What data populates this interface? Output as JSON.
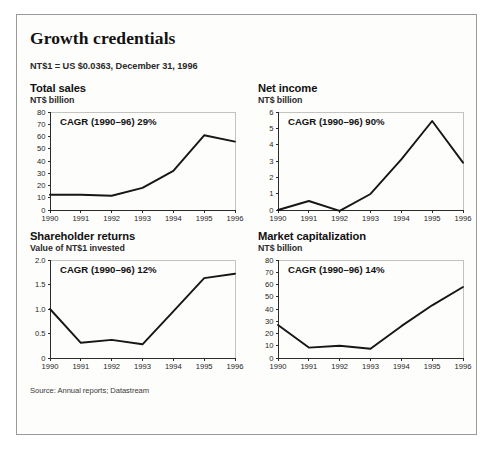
{
  "exhibit": {
    "title": "Growth credentials",
    "note": "NT$1 = US $0.0363, December 31, 1996",
    "source": "Source: Annual reports; Datastream"
  },
  "chart_data": [
    {
      "id": "total-sales",
      "type": "line",
      "title": "Total sales",
      "subtitle": "NT$ billion",
      "annotation": "CAGR (1990–96) 29%",
      "xlabel": "",
      "ylabel": "NT$ billion",
      "categories": [
        "1990",
        "1991",
        "1992",
        "1993",
        "1994",
        "1995",
        "1996"
      ],
      "values": [
        12.5,
        12.4,
        11.6,
        18.0,
        32.0,
        61.0,
        55.8
      ],
      "ylim": [
        0,
        80
      ],
      "yticks": [
        0,
        10,
        20,
        30,
        40,
        50,
        60,
        70,
        80
      ],
      "yticklabels": [
        "0",
        "10",
        "20",
        "30",
        "40",
        "50",
        "60",
        "70",
        "80"
      ],
      "grid": false,
      "legend": "none"
    },
    {
      "id": "net-income",
      "type": "line",
      "title": "Net income",
      "subtitle": "NT$ billion",
      "annotation": "CAGR (1990–96) 90%",
      "xlabel": "",
      "ylabel": "NT$ billion",
      "categories": [
        "1990",
        "1991",
        "1992",
        "1993",
        "1994",
        "1995",
        "1996"
      ],
      "values": [
        0.0,
        0.55,
        -0.05,
        0.98,
        3.1,
        5.45,
        2.9
      ],
      "ylim": [
        0,
        6
      ],
      "yticks": [
        0,
        1,
        2,
        3,
        4,
        5,
        6
      ],
      "yticklabels": [
        "0",
        "1",
        "2",
        "3",
        "4",
        "5",
        "6"
      ],
      "grid": false,
      "legend": "none"
    },
    {
      "id": "shareholder-returns",
      "type": "line",
      "title": "Shareholder returns",
      "subtitle": "Value of NT$1 invested",
      "annotation": "CAGR (1990–96) 12%",
      "xlabel": "",
      "ylabel": "Value of NT$1 invested",
      "categories": [
        "1990",
        "1991",
        "1992",
        "1993",
        "1994",
        "1995",
        "1996"
      ],
      "values": [
        1.0,
        0.31,
        0.37,
        0.28,
        0.95,
        1.63,
        1.72
      ],
      "ylim": [
        0,
        2.0
      ],
      "yticks": [
        0,
        0.5,
        1.0,
        1.5,
        2.0
      ],
      "yticklabels": [
        "0",
        "0.5",
        "1.0",
        "1.5",
        "2.0"
      ],
      "grid": false,
      "legend": "none"
    },
    {
      "id": "market-capitalization",
      "type": "line",
      "title": "Market capitalization",
      "subtitle": "NT$ billion",
      "annotation": "CAGR (1990–96) 14%",
      "xlabel": "",
      "ylabel": "NT$ billion",
      "categories": [
        "1990",
        "1991",
        "1992",
        "1993",
        "1994",
        "1995",
        "1996"
      ],
      "values": [
        27.0,
        8.5,
        10.0,
        7.5,
        26.0,
        43.0,
        58.0
      ],
      "ylim": [
        0,
        80
      ],
      "yticks": [
        0,
        10,
        20,
        30,
        40,
        50,
        60,
        70,
        80
      ],
      "yticklabels": [
        "0",
        "10",
        "20",
        "30",
        "40",
        "50",
        "60",
        "70",
        "80"
      ],
      "grid": false,
      "legend": "none"
    }
  ]
}
